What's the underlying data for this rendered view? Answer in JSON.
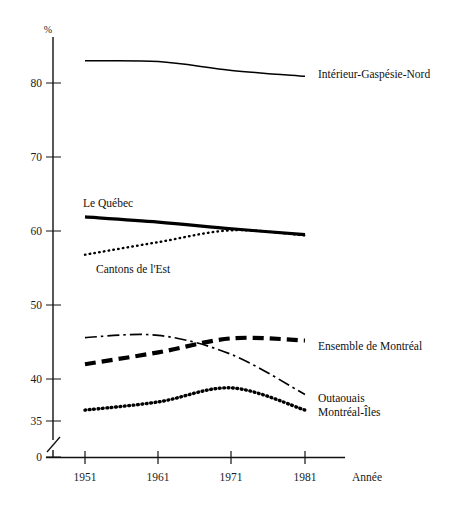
{
  "chart_data": {
    "type": "line",
    "title": "",
    "subtitle": "",
    "xlabel": "Année",
    "ylabel": "%",
    "ylim": [
      35,
      85
    ],
    "xlim": [
      1951,
      1981
    ],
    "grid": false,
    "legend_position": "right-inline",
    "axis_break": true,
    "x": [
      1951,
      1961,
      1971,
      1981
    ],
    "categories": [
      "1951",
      "1961",
      "1971",
      "1981"
    ],
    "ytick_labels": [
      "0",
      "35",
      "40",
      "50",
      "60",
      "70",
      "80"
    ],
    "ytick_values": [
      0,
      35,
      40,
      50,
      60,
      70,
      80
    ],
    "xtick_labels": [
      "1951",
      "1961",
      "1971",
      "1981"
    ],
    "series": [
      {
        "name": "Intérieur-Gaspésie-Nord",
        "style": "solid-thin",
        "values": [
          83.0,
          82.9,
          81.7,
          80.9
        ]
      },
      {
        "name": "Le Québec",
        "style": "solid-thick",
        "values": [
          61.9,
          61.2,
          60.3,
          59.5
        ]
      },
      {
        "name": "Cantons de l'Est",
        "style": "dotted",
        "values": [
          56.8,
          58.5,
          60.1,
          59.4
        ]
      },
      {
        "name": "Ensemble de Montréal",
        "style": "dashed-thick",
        "values": [
          42.0,
          43.6,
          45.5,
          45.2
        ]
      },
      {
        "name": "Outaouais",
        "style": "dash-dot",
        "values": [
          45.6,
          45.9,
          43.3,
          37.9
        ]
      },
      {
        "name": "Montréal-Îles",
        "style": "dotted-thick",
        "values": [
          35.8,
          36.9,
          38.8,
          35.8
        ]
      }
    ]
  },
  "axis": {
    "y_unit": "%",
    "x_title": "Année"
  },
  "labels": {
    "interieur": "Intérieur-Gaspésie-Nord",
    "quebec": "Le Québec",
    "cantons": "Cantons de l'Est",
    "ensemble": "Ensemble de Montréal",
    "outaouais": "Outaouais",
    "montreal_iles": "Montréal-Îles"
  },
  "ticks": {
    "y": [
      "80",
      "70",
      "60",
      "50",
      "40",
      "35",
      "0"
    ],
    "x": [
      "1951",
      "1961",
      "1971",
      "1981"
    ]
  },
  "colors": {
    "ink": "#000000",
    "background": "#ffffff"
  }
}
